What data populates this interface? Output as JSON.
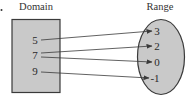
{
  "diagram": {
    "type": "function-mapping",
    "domain": {
      "label": "Domain",
      "values": [
        "5",
        "7",
        "9"
      ]
    },
    "range": {
      "label": "Range",
      "values": [
        "3",
        "2",
        "0",
        "-1"
      ]
    },
    "mappings": [
      {
        "from": "5",
        "to": "3"
      },
      {
        "from": "7",
        "to": "2"
      },
      {
        "from": "7",
        "to": "0"
      },
      {
        "from": "9",
        "to": "-1"
      }
    ],
    "colors": {
      "shape_fill": "#c9c9c9",
      "shape_stroke": "#3a3a3a",
      "arrow": "#3a3a3a",
      "text": "#2a2a2a"
    }
  }
}
